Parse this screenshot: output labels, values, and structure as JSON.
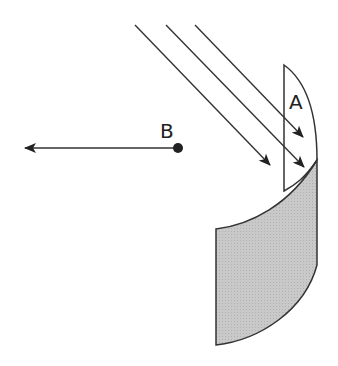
{
  "diagram": {
    "labels": {
      "A": "A",
      "B": "B"
    },
    "colors": {
      "stroke": "#333333",
      "fill_shaded": "#c8c8c8",
      "background": "#ffffff"
    },
    "rays": [
      {
        "x1": 135,
        "y1": 25,
        "x2": 270,
        "y2": 165
      },
      {
        "x1": 166,
        "y1": 25,
        "x2": 304,
        "y2": 167
      },
      {
        "x1": 195,
        "y1": 25,
        "x2": 303,
        "y2": 137
      }
    ],
    "point_B": {
      "x": 178,
      "y": 148
    },
    "arrow_B": {
      "x1": 178,
      "y1": 148,
      "x2": 25,
      "y2": 148
    }
  }
}
